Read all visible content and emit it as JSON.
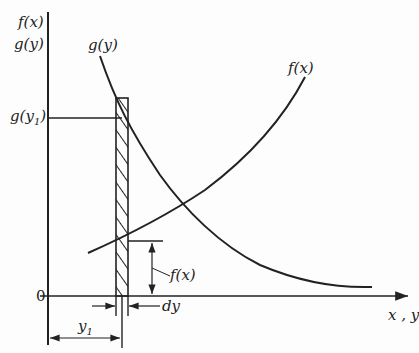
{
  "diagram": {
    "type": "function-graph",
    "axes": {
      "y_label_top": "f(x)",
      "y_label_bottom": "g(y)",
      "x_label": "x , y",
      "origin_label": "0"
    },
    "curves": [
      {
        "name": "g(y)",
        "label": "g(y)",
        "shape": "decreasing"
      },
      {
        "name": "f(x)",
        "label": "f(x)",
        "shape": "increasing"
      }
    ],
    "annotations": {
      "g_y1": "g(y",
      "g_y1_sub": "1",
      "g_y1_close": ")",
      "f_x_height": "f(x)",
      "dy": "dy",
      "y1": "y",
      "y1_sub": "1"
    },
    "colors": {
      "ink": "#222222",
      "background": "#fdfdfd"
    }
  }
}
